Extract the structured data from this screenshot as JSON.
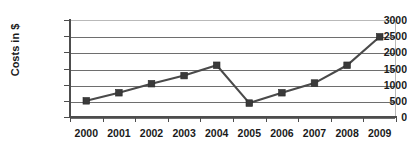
{
  "chart_data": {
    "type": "line",
    "title": "",
    "xlabel": "",
    "ylabel": "Costs in $",
    "categories": [
      "2000",
      "2001",
      "2002",
      "2003",
      "2004",
      "2005",
      "2006",
      "2007",
      "2008",
      "2009"
    ],
    "values": [
      500,
      750,
      1030,
      1280,
      1600,
      430,
      750,
      1050,
      1600,
      2480
    ],
    "series": [
      {
        "name": "Costs in $",
        "values": [
          500,
          750,
          1030,
          1280,
          1600,
          430,
          750,
          1050,
          1600,
          2480
        ]
      }
    ],
    "ylim": [
      0,
      3000
    ],
    "ytick_labels": [
      "0",
      "500",
      "1000",
      "1500",
      "2000",
      "2500",
      "3000"
    ],
    "ytick_values": [
      0,
      500,
      1000,
      1500,
      2000,
      2500,
      3000
    ],
    "grid": true,
    "legend": false,
    "legend_position": "none",
    "marker": "square",
    "line_color": "#4a4a4a",
    "marker_color": "#3a3a3a",
    "gridline_color": "#6e6e6e",
    "background_color": "#ffffff",
    "annotations": []
  }
}
